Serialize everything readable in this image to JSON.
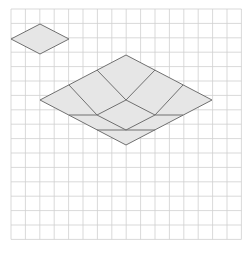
{
  "grid": {
    "x0": 11,
    "y0": 9,
    "cell": 14.4,
    "cols": 16,
    "rows": 16,
    "color": "#cfcfcf"
  },
  "colors": {
    "fill": "#e6e6e6",
    "stroke": "#707070",
    "background": "#ffffff"
  },
  "small_rhombus": {
    "points": [
      [
        11,
        39
      ],
      [
        40,
        24
      ],
      [
        69,
        39
      ],
      [
        40,
        54
      ]
    ]
  },
  "large_shape": {
    "outline": [
      [
        40,
        100
      ],
      [
        126,
        55
      ],
      [
        212,
        100
      ],
      [
        126,
        145
      ]
    ],
    "segments": [
      [
        [
          97,
          70
        ],
        [
          126,
          100
        ]
      ],
      [
        [
          155,
          70
        ],
        [
          126,
          100
        ]
      ],
      [
        [
          69,
          85
        ],
        [
          97,
          115
        ]
      ],
      [
        [
          183,
          85
        ],
        [
          155,
          115
        ]
      ],
      [
        [
          126,
          100
        ],
        [
          97,
          115
        ]
      ],
      [
        [
          126,
          100
        ],
        [
          155,
          115
        ]
      ],
      [
        [
          69,
          115
        ],
        [
          97,
          115
        ]
      ],
      [
        [
          155,
          115
        ],
        [
          183,
          115
        ]
      ],
      [
        [
          97,
          115
        ],
        [
          126,
          130
        ]
      ],
      [
        [
          155,
          115
        ],
        [
          126,
          130
        ]
      ],
      [
        [
          97,
          130
        ],
        [
          155,
          130
        ]
      ]
    ]
  }
}
